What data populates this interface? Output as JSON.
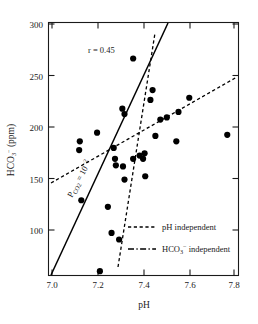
{
  "chart_data": {
    "type": "scatter",
    "title": "",
    "xlabel": "pH",
    "ylabel": "HCO3- (ppm)",
    "ylabel_parts": {
      "base": "HCO",
      "sub": "3",
      "sup": "−",
      "units": " (ppm)"
    },
    "xlim": [
      6.96,
      7.84
    ],
    "ylim": [
      68,
      300
    ],
    "xticks": [
      7.0,
      7.2,
      7.4,
      7.6,
      7.8
    ],
    "xticklabels": [
      "7.0",
      "7.2",
      "7.4",
      "7.6",
      "7.8"
    ],
    "yticks": [
      100,
      150,
      200,
      250,
      300
    ],
    "yticklabels": [
      "100",
      "150",
      "200",
      "250",
      "300"
    ],
    "grid": false,
    "annotations": [
      {
        "name": "correlation",
        "text": "r = 0.45",
        "x": 7.18,
        "y": 258
      },
      {
        "name": "pco2-line-label",
        "text": "P",
        "sub": "CO2",
        "rest": " = 10",
        "sup": "−2",
        "x": 7.13,
        "y": 128,
        "rotation": -58
      }
    ],
    "points": [
      {
        "x": 7.105,
        "y": 191
      },
      {
        "x": 7.102,
        "y": 183
      },
      {
        "x": 7.112,
        "y": 137
      },
      {
        "x": 7.185,
        "y": 199
      },
      {
        "x": 7.198,
        "y": 72
      },
      {
        "x": 7.235,
        "y": 131
      },
      {
        "x": 7.252,
        "y": 107
      },
      {
        "x": 7.262,
        "y": 185
      },
      {
        "x": 7.268,
        "y": 175
      },
      {
        "x": 7.272,
        "y": 169
      },
      {
        "x": 7.287,
        "y": 101
      },
      {
        "x": 7.302,
        "y": 221
      },
      {
        "x": 7.312,
        "y": 216
      },
      {
        "x": 7.305,
        "y": 168
      },
      {
        "x": 7.312,
        "y": 156
      },
      {
        "x": 7.352,
        "y": 267
      },
      {
        "x": 7.352,
        "y": 175
      },
      {
        "x": 7.382,
        "y": 178
      },
      {
        "x": 7.398,
        "y": 175
      },
      {
        "x": 7.405,
        "y": 180
      },
      {
        "x": 7.408,
        "y": 159
      },
      {
        "x": 7.432,
        "y": 229
      },
      {
        "x": 7.442,
        "y": 238
      },
      {
        "x": 7.455,
        "y": 196
      },
      {
        "x": 7.478,
        "y": 211
      },
      {
        "x": 7.508,
        "y": 213
      },
      {
        "x": 7.552,
        "y": 191
      },
      {
        "x": 7.562,
        "y": 218
      },
      {
        "x": 7.612,
        "y": 231
      },
      {
        "x": 7.788,
        "y": 197
      }
    ],
    "lines": [
      {
        "name": "pco2-solid",
        "style": "solid",
        "x0": 6.995,
        "y0": 68,
        "x1": 7.495,
        "y1": 300
      },
      {
        "name": "ph-independent",
        "style": "dashed",
        "x0": 7.012,
        "y0": 145,
        "x1": 7.822,
        "y1": 247
      },
      {
        "name": "hco3-independent",
        "style": "dashed-steep",
        "x0": 7.205,
        "y0": 76,
        "x1": 7.395,
        "y1": 265
      }
    ],
    "legend": {
      "position": "lower-right",
      "entries": [
        {
          "name": "legend-ph-independent",
          "label": "pH independent",
          "style": "dotted"
        },
        {
          "name": "legend-hco3-independent",
          "label": "HCO3- independent",
          "style": "dash-dot",
          "label_parts": {
            "base": "HCO",
            "sub": "3",
            "sup": "−",
            "rest": " independent"
          }
        }
      ]
    }
  }
}
